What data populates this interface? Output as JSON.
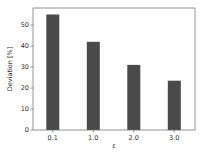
{
  "chart_data": {
    "type": "bar",
    "title": "",
    "xlabel": "ε",
    "ylabel": "Deviation [%]",
    "categories": [
      "0.1",
      "1.0",
      "2.0",
      "3.0"
    ],
    "values": [
      55,
      42,
      31,
      23.5
    ],
    "ylim": [
      0,
      58
    ],
    "yticks": [
      0,
      10,
      20,
      30,
      40,
      50
    ],
    "grid": false,
    "legend": null,
    "bar_color": "#4a4a4a"
  },
  "colors": {
    "bar": "#4a4a4a",
    "frame": "#555555",
    "text": "#333333"
  }
}
